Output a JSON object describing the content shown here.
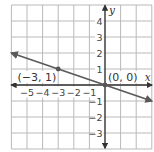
{
  "chart_data": {
    "type": "line",
    "title": "",
    "xlabel": "x",
    "ylabel": "y",
    "xlim": [
      -6,
      3
    ],
    "ylim": [
      -4,
      5
    ],
    "grid": true,
    "x_ticks": [
      -5,
      -4,
      -3,
      -2,
      -1
    ],
    "y_ticks": [
      4,
      3,
      2,
      1,
      -1,
      -2,
      -3
    ],
    "x_tick_labels": [
      "−5",
      "−4",
      "−3",
      "−2",
      "−1"
    ],
    "y_tick_labels": [
      "4",
      "3",
      "2",
      "1",
      "−1",
      "−2",
      "−3"
    ],
    "series": [
      {
        "name": "line y = -x/3",
        "equation": "y = -1/3 x",
        "slope": -0.3333,
        "intercept": 0,
        "x": [
          -6,
          3
        ],
        "y": [
          2,
          -1
        ],
        "arrows_both_ends": true
      }
    ],
    "points": [
      {
        "x": -3,
        "y": 1,
        "label": "(−3, 1)"
      },
      {
        "x": 0,
        "y": 0,
        "label": "(0, 0)"
      }
    ],
    "colors": {
      "grid": "#b9b9b9",
      "axes": "#333333",
      "line": "#5a5a5a",
      "background": "#ffffff"
    }
  }
}
